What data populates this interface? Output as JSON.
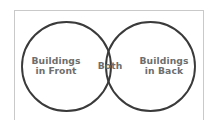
{
  "diagram": {
    "type": "venn-diagram",
    "title": "",
    "frame": {
      "border_color": "#c9c9c9",
      "background_color": "#ffffff"
    },
    "circle_stroke_color": "#3a3a3a",
    "label_color": "#6e6e6e",
    "sets": [
      {
        "id": "left",
        "name": "buildings-in-front",
        "label_lines": [
          "Buildings",
          "in Front"
        ],
        "label": "Buildings in Front",
        "cx": 66.5,
        "cy": 66.5,
        "r": 44.5
      },
      {
        "id": "right",
        "name": "buildings-in-back",
        "label_lines": [
          "Buildings",
          "in Back"
        ],
        "label": "Buildings in Back",
        "cx": 150.5,
        "cy": 66.5,
        "r": 44.5
      }
    ],
    "intersection": {
      "id": "both",
      "name": "both",
      "label": "Both"
    }
  }
}
